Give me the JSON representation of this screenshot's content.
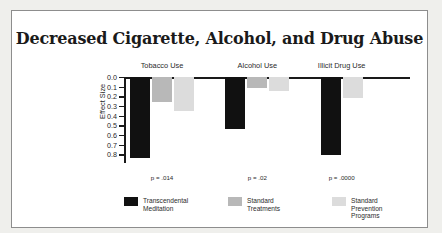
{
  "chart_data": {
    "type": "bar",
    "title": "Decreased Cigarette, Alcohol, and Drug Abuse",
    "xlabel": "",
    "ylabel": "Effect Size",
    "categories": [
      "Tobacco Use",
      "Alcohol Use",
      "Illicit Drug Use"
    ],
    "ylim": [
      0.0,
      0.85
    ],
    "y_axis_inverted": true,
    "y_ticks": [
      "0.0",
      "0.1",
      "0.2",
      "0.3",
      "0.4",
      "0.5",
      "0.6",
      "0.7",
      "0.8"
    ],
    "y_tick_values": [
      0.0,
      0.1,
      0.2,
      0.3,
      0.4,
      0.5,
      0.6,
      0.7,
      0.8
    ],
    "grid": false,
    "legend_position": "bottom",
    "series": [
      {
        "name": "Transcendental\nMeditation",
        "color": "#111111",
        "values": [
          0.84,
          0.54,
          0.81
        ]
      },
      {
        "name": "Standard\nTreatments",
        "color": "#b8b8b8",
        "values": [
          0.26,
          0.11,
          null
        ]
      },
      {
        "name": "Standard\nPrevention\nPrograms",
        "color": "#dcdcdc",
        "values": [
          0.35,
          0.14,
          0.22
        ]
      }
    ],
    "annotations": [
      "p = .014",
      "p = .02",
      "p = .0000"
    ]
  },
  "legend": [
    {
      "label": "Transcendental\nMeditation",
      "color": "#111111"
    },
    {
      "label": "Standard\nTreatments",
      "color": "#b8b8b8"
    },
    {
      "label": "Standard\nPrevention\nPrograms",
      "color": "#dcdcdc"
    }
  ]
}
